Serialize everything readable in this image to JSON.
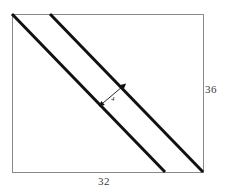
{
  "figure": {
    "kind": "geometry-diagram",
    "labels": {
      "height": "36",
      "width": "32",
      "band_width": "4"
    },
    "colors": {
      "background": "#ffffff",
      "rectangle_stroke": "#8a8a8a",
      "band_stroke": "#111111",
      "arrow_stroke": "#111111",
      "label_text": "#3a3a3a"
    },
    "geometry": {
      "rect": {
        "x": 12,
        "y": 14,
        "width": 191,
        "height": 158
      },
      "band_line_1": {
        "x1": 12,
        "y1": 14,
        "x2": 165,
        "y2": 172
      },
      "band_line_2": {
        "x1": 50,
        "y1": 14,
        "x2": 203,
        "y2": 172
      },
      "band_stroke_width": 3,
      "rect_stroke_width": 1,
      "arrow": {
        "x1": 103,
        "y1": 103,
        "x2": 122,
        "y2": 87,
        "double_headed": true
      }
    }
  }
}
